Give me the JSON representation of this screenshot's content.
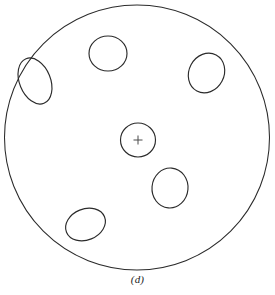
{
  "figure": {
    "caption": "(d)",
    "stroke_color": "#2b2b2b",
    "marker_color": "#4a4a4a",
    "background_color": "#ffffff",
    "canvas": {
      "width": 275,
      "height": 295
    },
    "boundary": {
      "name": "outer-circle",
      "cx": 137,
      "cy": 137.5,
      "r": 132.5
    },
    "center_marker": {
      "name": "center-cross",
      "cx": 138,
      "cy": 140,
      "arm": 4.5
    },
    "inclusions": [
      {
        "id": "center-circle",
        "cx": 138,
        "cy": 140,
        "rx": 17.5,
        "ry": 17.0,
        "rot": 0
      },
      {
        "id": "top-circle",
        "cx": 108,
        "cy": 53.5,
        "rx": 19.0,
        "ry": 17.5,
        "rot": 0
      },
      {
        "id": "upper-left-ellipse",
        "cx": 35,
        "cy": 81,
        "rx": 15.5,
        "ry": 24.0,
        "rot": -22
      },
      {
        "id": "right-ellipse",
        "cx": 206.5,
        "cy": 73,
        "rx": 17.5,
        "ry": 20.5,
        "rot": 28
      },
      {
        "id": "lower-right-circle",
        "cx": 170,
        "cy": 188,
        "rx": 18.0,
        "ry": 20.0,
        "rot": 5
      },
      {
        "id": "bottom-left-ellipse",
        "cx": 85.5,
        "cy": 224.5,
        "rx": 20.5,
        "ry": 15.5,
        "rot": -22
      }
    ]
  }
}
